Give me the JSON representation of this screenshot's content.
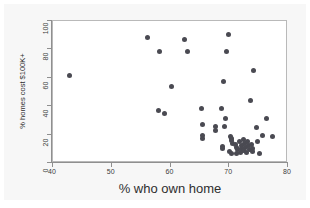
{
  "chart_data": {
    "type": "scatter",
    "title": "",
    "xlabel": "% who own home",
    "ylabel": "% homes cost $100K+",
    "xlim": [
      40,
      80
    ],
    "ylim": [
      0,
      100
    ],
    "xticks": [
      40,
      50,
      60,
      70,
      80
    ],
    "yticks": [
      0,
      20,
      40,
      60,
      80,
      100
    ],
    "grid": false,
    "legend": null,
    "marker": {
      "shape": "circle",
      "color": "#4a4a52",
      "size": 5
    },
    "points": [
      {
        "x": 42.8,
        "y": 61.8
      },
      {
        "x": 56.1,
        "y": 88.6
      },
      {
        "x": 58.2,
        "y": 78.2
      },
      {
        "x": 57.9,
        "y": 36.9
      },
      {
        "x": 58.9,
        "y": 34.7
      },
      {
        "x": 60.2,
        "y": 53.9
      },
      {
        "x": 62.4,
        "y": 86.7
      },
      {
        "x": 62.9,
        "y": 78.8
      },
      {
        "x": 65.3,
        "y": 38.6
      },
      {
        "x": 65.5,
        "y": 26.9
      },
      {
        "x": 65.4,
        "y": 19.6
      },
      {
        "x": 65.5,
        "y": 17.4
      },
      {
        "x": 67.7,
        "y": 26.0
      },
      {
        "x": 67.7,
        "y": 22.7
      },
      {
        "x": 68.6,
        "y": 38.5
      },
      {
        "x": 69.4,
        "y": 31.0
      },
      {
        "x": 69.2,
        "y": 25.6
      },
      {
        "x": 68.8,
        "y": 11.8
      },
      {
        "x": 68.9,
        "y": 10.3
      },
      {
        "x": 69.0,
        "y": 57.4
      },
      {
        "x": 69.5,
        "y": 78.5
      },
      {
        "x": 69.9,
        "y": 90.7
      },
      {
        "x": 70.2,
        "y": 19.0
      },
      {
        "x": 70.4,
        "y": 17.2
      },
      {
        "x": 70.3,
        "y": 15.6
      },
      {
        "x": 70.6,
        "y": 13.8
      },
      {
        "x": 70.1,
        "y": 8.4
      },
      {
        "x": 70.4,
        "y": 6.6
      },
      {
        "x": 71.0,
        "y": 12.9
      },
      {
        "x": 71.2,
        "y": 10.8
      },
      {
        "x": 71.4,
        "y": 9.2
      },
      {
        "x": 71.3,
        "y": 6.9
      },
      {
        "x": 71.8,
        "y": 14.8
      },
      {
        "x": 72.0,
        "y": 12.2
      },
      {
        "x": 72.1,
        "y": 10.0
      },
      {
        "x": 71.9,
        "y": 7.6
      },
      {
        "x": 72.5,
        "y": 16.4
      },
      {
        "x": 72.6,
        "y": 13.4
      },
      {
        "x": 72.7,
        "y": 11.0
      },
      {
        "x": 72.4,
        "y": 8.6
      },
      {
        "x": 73.1,
        "y": 15.2
      },
      {
        "x": 73.2,
        "y": 12.6
      },
      {
        "x": 73.4,
        "y": 9.8
      },
      {
        "x": 73.0,
        "y": 7.2
      },
      {
        "x": 73.6,
        "y": 44.1
      },
      {
        "x": 73.8,
        "y": 13.1
      },
      {
        "x": 74.0,
        "y": 10.4
      },
      {
        "x": 73.9,
        "y": 7.9
      },
      {
        "x": 74.2,
        "y": 64.9
      },
      {
        "x": 74.6,
        "y": 24.8
      },
      {
        "x": 74.8,
        "y": 15.4
      },
      {
        "x": 75.1,
        "y": 7.0
      },
      {
        "x": 76.3,
        "y": 31.5
      },
      {
        "x": 75.6,
        "y": 19.1
      },
      {
        "x": 77.4,
        "y": 18.5
      }
    ]
  }
}
